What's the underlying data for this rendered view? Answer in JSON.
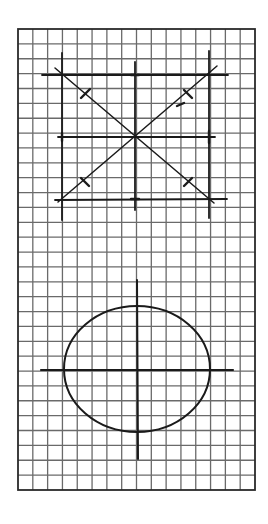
{
  "page": {
    "width": 268,
    "height": 524,
    "background": "#ffffff"
  },
  "grid": {
    "x": 18,
    "y": 29,
    "width": 237,
    "height": 461,
    "cols": 16,
    "rows": 31,
    "line_color": "#6a6a6a",
    "border_color": "#2a2a2a"
  },
  "ink_color": "#1a1a1a",
  "figure_top": {
    "label": "symmetry-cross-diagram",
    "horizontal_lines": [
      {
        "x1": 42,
        "y1": 75,
        "x2": 228,
        "y2": 75
      },
      {
        "x1": 58,
        "y1": 137,
        "x2": 215,
        "y2": 137
      },
      {
        "x1": 55,
        "y1": 200,
        "x2": 227,
        "y2": 199
      }
    ],
    "vertical_lines": [
      {
        "x1": 62,
        "y1": 53,
        "x2": 62,
        "y2": 220
      },
      {
        "x1": 135,
        "y1": 62,
        "x2": 135,
        "y2": 210
      },
      {
        "x1": 209,
        "y1": 51,
        "x2": 209,
        "y2": 218
      }
    ],
    "diagonals": [
      {
        "x1": 55,
        "y1": 68,
        "x2": 214,
        "y2": 203
      },
      {
        "x1": 58,
        "y1": 202,
        "x2": 217,
        "y2": 66
      }
    ],
    "tick_marks": [
      {
        "x1": 81,
        "y1": 98,
        "x2": 90,
        "y2": 89
      },
      {
        "x1": 184,
        "y1": 90,
        "x2": 192,
        "y2": 98
      },
      {
        "x1": 81,
        "y1": 178,
        "x2": 89,
        "y2": 186
      },
      {
        "x1": 184,
        "y1": 186,
        "x2": 192,
        "y2": 178
      },
      {
        "x1": 131,
        "y1": 75,
        "x2": 139,
        "y2": 75
      },
      {
        "x1": 131,
        "y1": 199,
        "x2": 139,
        "y2": 199
      },
      {
        "x1": 62,
        "y1": 133,
        "x2": 62,
        "y2": 141
      },
      {
        "x1": 209,
        "y1": 131,
        "x2": 209,
        "y2": 143
      },
      {
        "x1": 177,
        "y1": 106,
        "x2": 184,
        "y2": 103
      }
    ]
  },
  "figure_bottom": {
    "label": "ellipse-with-axes",
    "ellipse": {
      "cx": 137,
      "cy": 369,
      "rx": 73,
      "ry": 63
    },
    "horizontal_axis": {
      "x1": 41,
      "y1": 370,
      "x2": 233,
      "y2": 370
    },
    "vertical_axis": {
      "x1": 137,
      "y1": 280,
      "x2": 138,
      "y2": 459
    }
  }
}
